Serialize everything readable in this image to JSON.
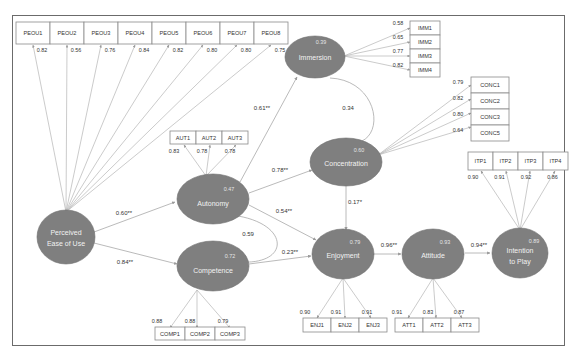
{
  "figure": {
    "type": "structural-equation-model",
    "latent_variables": [
      {
        "id": "peou",
        "label_lines": [
          "Perceived",
          "Ease of Use"
        ],
        "r2": ""
      },
      {
        "id": "aut",
        "label_lines": [
          "Autonomy"
        ],
        "r2": "0.47"
      },
      {
        "id": "comp",
        "label_lines": [
          "Competence"
        ],
        "r2": "0.72"
      },
      {
        "id": "imm",
        "label_lines": [
          "Immersion"
        ],
        "r2": "0.39"
      },
      {
        "id": "conc",
        "label_lines": [
          "Concentration"
        ],
        "r2": "0.60"
      },
      {
        "id": "enj",
        "label_lines": [
          "Enjoyment"
        ],
        "r2": "0.79"
      },
      {
        "id": "att",
        "label_lines": [
          "Attitude"
        ],
        "r2": "0.93"
      },
      {
        "id": "itp",
        "label_lines": [
          "Intention",
          "to Play"
        ],
        "r2": "0.89"
      }
    ],
    "indicators": {
      "peou": [
        {
          "label": "PEOU1",
          "loading": "0.82"
        },
        {
          "label": "PEOU2",
          "loading": "0.56"
        },
        {
          "label": "PEOU3",
          "loading": "0.76"
        },
        {
          "label": "PEOU4",
          "loading": "0.84"
        },
        {
          "label": "PEOU5",
          "loading": "0.82"
        },
        {
          "label": "PEOU6",
          "loading": "0.80"
        },
        {
          "label": "PEOU7",
          "loading": "0.80"
        },
        {
          "label": "PEOU8",
          "loading": "0.75"
        }
      ],
      "imm": [
        {
          "label": "IMM1",
          "loading": "0.58"
        },
        {
          "label": "IMM2",
          "loading": "0.65"
        },
        {
          "label": "IMM3",
          "loading": "0.77"
        },
        {
          "label": "IMM4",
          "loading": "0.82"
        }
      ],
      "conc": [
        {
          "label": "CONC1",
          "loading": "0.79"
        },
        {
          "label": "CONC2",
          "loading": "0.82"
        },
        {
          "label": "CONC3",
          "loading": "0.80"
        },
        {
          "label": "CONC5",
          "loading": "0.64"
        }
      ],
      "aut": [
        {
          "label": "AUT1",
          "loading": "0.83"
        },
        {
          "label": "AUT2",
          "loading": "0.78"
        },
        {
          "label": "AUT3",
          "loading": "0.78"
        }
      ],
      "itp": [
        {
          "label": "ITP1",
          "loading": "0.90"
        },
        {
          "label": "ITP2",
          "loading": "0.91"
        },
        {
          "label": "ITP3",
          "loading": "0.92"
        },
        {
          "label": "ITP4",
          "loading": "0.86"
        }
      ],
      "comp": [
        {
          "label": "COMP1",
          "loading": "0.88"
        },
        {
          "label": "COMP2",
          "loading": "0.88"
        },
        {
          "label": "COMP3",
          "loading": "0.79"
        }
      ],
      "enj": [
        {
          "label": "ENJ1",
          "loading": "0.90"
        },
        {
          "label": "ENJ2",
          "loading": "0.91"
        },
        {
          "label": "ENJ3",
          "loading": "0.91"
        }
      ],
      "att": [
        {
          "label": "ATT1",
          "loading": "0.91"
        },
        {
          "label": "ATT2",
          "loading": "0.83"
        },
        {
          "label": "ATT3",
          "loading": "0.87"
        }
      ]
    },
    "paths": [
      {
        "from": "peou",
        "to": "aut",
        "coef": "0.60**"
      },
      {
        "from": "peou",
        "to": "comp",
        "coef": "0.84**"
      },
      {
        "from": "aut",
        "to": "imm",
        "coef": "0.61**"
      },
      {
        "from": "aut",
        "to": "conc",
        "coef": "0.78**"
      },
      {
        "from": "aut",
        "to": "enj",
        "coef": "0.54**"
      },
      {
        "from": "comp",
        "to": "enj",
        "coef": "0.23**"
      },
      {
        "from": "conc",
        "to": "enj",
        "coef": "0.17*"
      },
      {
        "from": "enj",
        "to": "att",
        "coef": "0.96**"
      },
      {
        "from": "att",
        "to": "itp",
        "coef": "0.94**"
      }
    ],
    "covariances": [
      {
        "between": [
          "aut",
          "comp"
        ],
        "value": "0.59"
      },
      {
        "between": [
          "imm",
          "conc"
        ],
        "value": "0.34"
      }
    ]
  }
}
